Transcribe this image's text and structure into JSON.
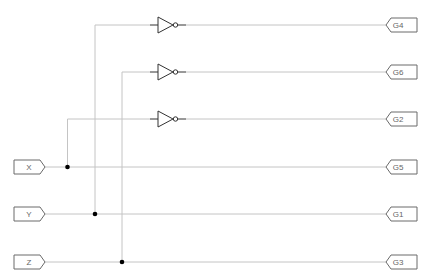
{
  "diagram": {
    "type": "logic-schematic",
    "colors": {
      "wire": "#c4c4c4",
      "gate": "#333333",
      "port": "#6a6a6a",
      "junction": "#000000",
      "background": "#ffffff"
    },
    "inputs": [
      {
        "id": "X",
        "label": "X",
        "y": 167,
        "branch_x": 67.5
      },
      {
        "id": "Y",
        "label": "Y",
        "y": 214,
        "branch_x": 95
      },
      {
        "id": "Z",
        "label": "Z",
        "y": 262,
        "branch_x": 122
      }
    ],
    "gates": [
      {
        "type": "NOT",
        "input": "Y",
        "output": "G4",
        "y": 25
      },
      {
        "type": "NOT",
        "input": "Z",
        "output": "G6",
        "y": 72
      },
      {
        "type": "NOT",
        "input": "X",
        "output": "G2",
        "y": 119
      }
    ],
    "outputs": [
      {
        "id": "G4",
        "label": "G4",
        "y": 25,
        "source": "NOT(Y)"
      },
      {
        "id": "G6",
        "label": "G6",
        "y": 72,
        "source": "NOT(Z)"
      },
      {
        "id": "G2",
        "label": "G2",
        "y": 119,
        "source": "NOT(X)"
      },
      {
        "id": "G5",
        "label": "G5",
        "y": 167,
        "source": "X"
      },
      {
        "id": "G1",
        "label": "G1",
        "y": 214,
        "source": "Y"
      },
      {
        "id": "G3",
        "label": "G3",
        "y": 262,
        "source": "Z"
      }
    ]
  }
}
